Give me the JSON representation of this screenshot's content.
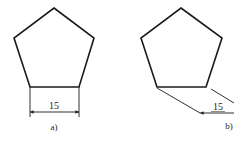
{
  "figures": [
    {
      "id": "a",
      "caption": "a)",
      "dimension_value": "15",
      "shape": "regular-pentagon",
      "dimension_style": "horizontal-linear"
    },
    {
      "id": "b",
      "caption": "b)",
      "dimension_value": "15",
      "shape": "regular-pentagon",
      "dimension_style": "aligned-oblique"
    }
  ],
  "colors": {
    "stroke": "#1a1a1a",
    "background": "#ffffff"
  }
}
